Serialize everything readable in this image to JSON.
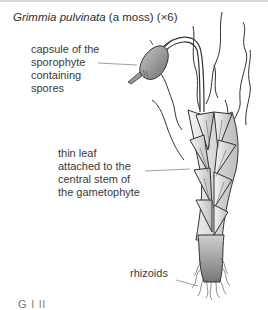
{
  "figure": {
    "title_species": "Grimmia pulvinata",
    "title_common": " (a moss) ",
    "title_magnification": "(×6)"
  },
  "labels": {
    "capsule": [
      "capsule of the",
      "sporophyte",
      "containing",
      "spores"
    ],
    "leaf": [
      "thin leaf",
      "attached to the",
      "central stem of",
      "the gametophyte"
    ],
    "rhizoids": "rhizoids"
  },
  "cutoff_text": "G          l          ll"
}
